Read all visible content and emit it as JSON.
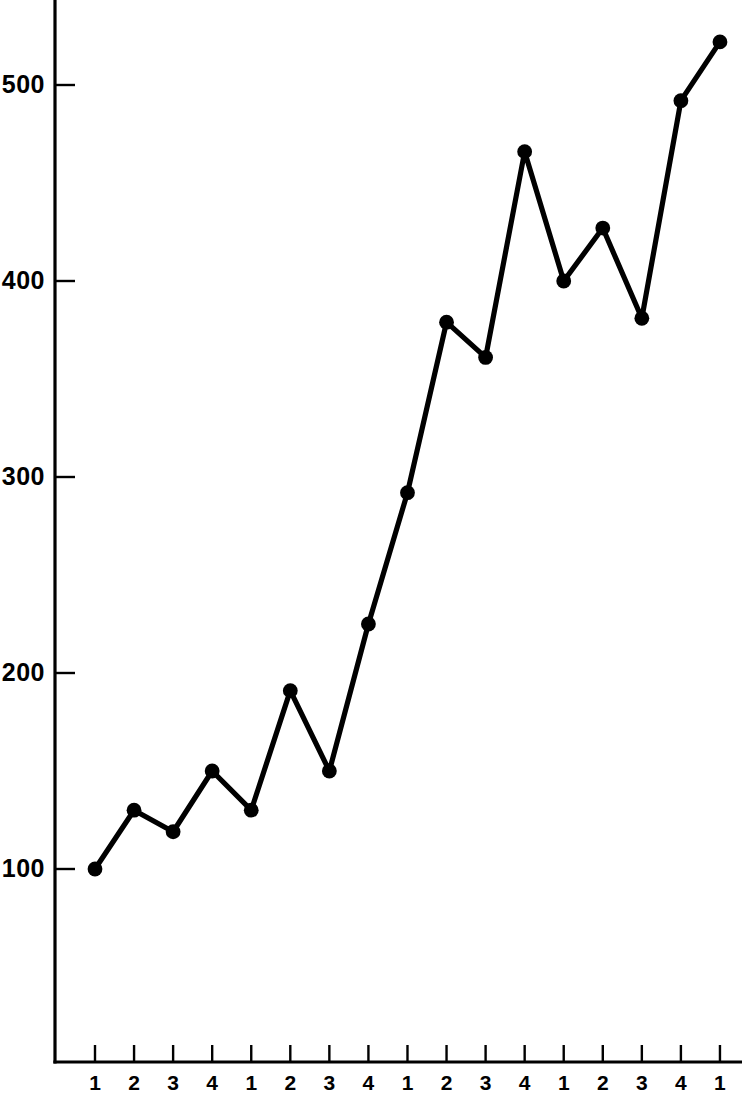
{
  "chart_data": {
    "type": "line",
    "title": "",
    "subtitle": "",
    "xlabel": "",
    "ylabel": "",
    "grid": false,
    "legend": false,
    "legend_position": "none",
    "marker": "filled-circle",
    "line_color": "#000000",
    "marker_color": "#000000",
    "background_color": "#ffffff",
    "xlim": [
      0,
      18
    ],
    "ylim": [
      0,
      560
    ],
    "y_ticks": [
      100,
      200,
      300,
      400,
      500
    ],
    "y_tick_labels": [
      "100",
      "200",
      "300",
      "400",
      "500"
    ],
    "x_tick_labels": [
      "1",
      "2",
      "3",
      "4",
      "1",
      "2",
      "3",
      "4",
      "1",
      "2",
      "3",
      "4",
      "1",
      "2",
      "3",
      "4",
      "1"
    ],
    "categories": [
      "1",
      "2",
      "3",
      "4",
      "1",
      "2",
      "3",
      "4",
      "1",
      "2",
      "3",
      "4",
      "1",
      "2",
      "3",
      "4",
      "1"
    ],
    "x": [
      1,
      2,
      3,
      4,
      5,
      6,
      7,
      8,
      9,
      10,
      11,
      12,
      13,
      14,
      15,
      16,
      17
    ],
    "values": [
      100,
      130,
      119,
      150,
      130,
      191,
      150,
      225,
      292,
      379,
      361,
      466,
      400,
      427,
      381,
      492,
      522
    ],
    "series": [
      {
        "name": "index",
        "values": [
          100,
          130,
          119,
          150,
          130,
          191,
          150,
          225,
          292,
          379,
          361,
          466,
          400,
          427,
          381,
          492,
          522
        ]
      }
    ],
    "annotations": []
  },
  "axes": {
    "y_axis_name": "y-axis",
    "x_axis_name": "x-axis"
  }
}
